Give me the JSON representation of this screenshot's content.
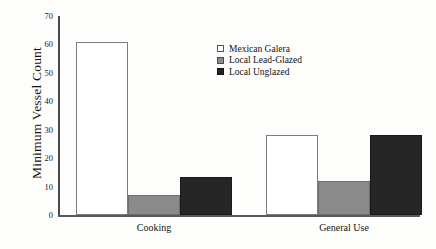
{
  "chart_data": {
    "type": "bar",
    "title": "",
    "subtitle": "",
    "xlabel": "",
    "ylabel": "Minimum Vessel Count",
    "categories": [
      "Cooking",
      "General Use"
    ],
    "series": [
      {
        "name": "Mexican Galera",
        "values": [
          61,
          28
        ],
        "color": "#ffffff",
        "swatch": "swatch-white"
      },
      {
        "name": "Local Lead-Glazed",
        "values": [
          7,
          12
        ],
        "color": "#8a8a8a",
        "swatch": "swatch-gray"
      },
      {
        "name": "Local Unglazed",
        "values": [
          13.5,
          28
        ],
        "color": "#262626",
        "swatch": "swatch-dark"
      }
    ],
    "ylim": [
      0,
      70
    ],
    "yticks": [
      0,
      10,
      20,
      30,
      40,
      50,
      60,
      70
    ],
    "ytick_labels": [
      "0",
      "10",
      "20",
      "30",
      "40",
      "50",
      "60",
      "70"
    ],
    "grid": false,
    "legend_position": "upper-center"
  }
}
